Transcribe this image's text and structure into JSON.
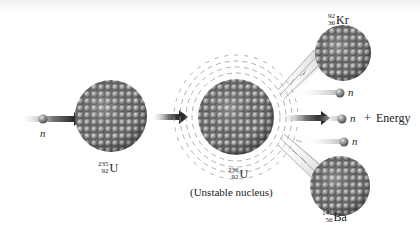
{
  "colors": {
    "nucleon": "#8c8c8c",
    "nucleon_highlight": "#d6d6d6",
    "nucleon_shadow": "#555555",
    "arrow_dark": "#2a2a2a",
    "text": "#222222"
  },
  "incoming_neutron": {
    "label": "n"
  },
  "reactant": {
    "mass_number": "235",
    "atomic_number": "92",
    "symbol": "U"
  },
  "intermediate": {
    "mass_number": "236",
    "atomic_number": "92",
    "symbol": "U",
    "caption": "(Unstable nucleus)"
  },
  "products": {
    "krypton": {
      "mass_number": "92",
      "atomic_number": "36",
      "symbol": "Kr"
    },
    "barium": {
      "mass_number": "141",
      "atomic_number": "56",
      "symbol": "Ba"
    },
    "neutrons": [
      {
        "label": "n"
      },
      {
        "label": "n"
      },
      {
        "label": "n"
      }
    ],
    "plus": "+",
    "energy_label": "Energy"
  },
  "icons": {
    "neutron": "neutron-sphere-icon",
    "nucleus": "nucleus-cluster-icon",
    "arrow": "right-arrow-icon"
  }
}
